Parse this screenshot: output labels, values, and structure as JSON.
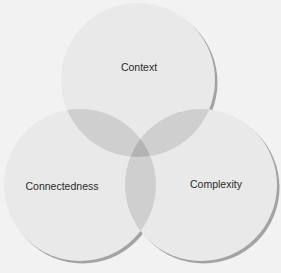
{
  "diagram": {
    "type": "venn",
    "background": "#f2f2f2",
    "circle_fill": "#e9e9e9",
    "overlap2_fill": "#cfcfcf",
    "overlap3_fill": "#b3b3b3",
    "shadow_color": "#9c9c9c",
    "circles": [
      {
        "id": "context",
        "label": "Context",
        "cx": 138,
        "cy": 80,
        "r": 77,
        "label_x": 139,
        "label_y": 71
      },
      {
        "id": "connectedness",
        "label": "Connectedness",
        "cx": 80,
        "cy": 185,
        "r": 76,
        "label_x": 62,
        "label_y": 190
      },
      {
        "id": "complexity",
        "label": "Complexity",
        "cx": 201,
        "cy": 185,
        "r": 76,
        "label_x": 216,
        "label_y": 188
      }
    ]
  }
}
